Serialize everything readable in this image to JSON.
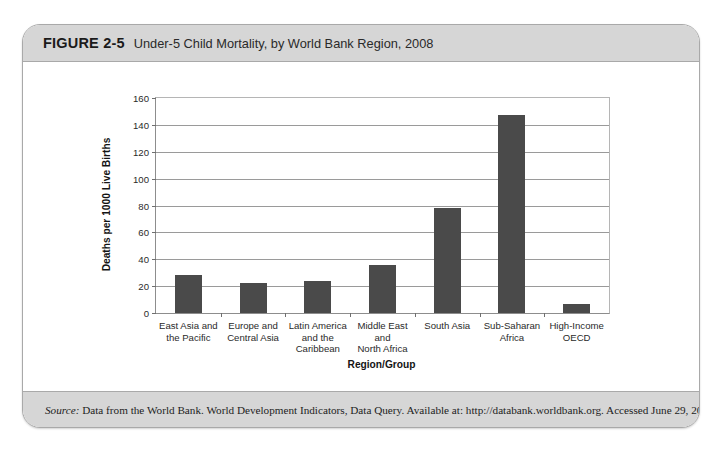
{
  "figure": {
    "number": "FIGURE 2-5",
    "title": "Under-5 Child Mortality, by World Bank Region, 2008",
    "source_label": "Source:",
    "source_text": " Data from the World Bank. World Development Indicators, Data Query. Available at: http://databank.worldbank.org. Accessed June 29, 2010."
  },
  "style": {
    "bar_color": "#4a4a4a",
    "band_color": "#d6d6d6",
    "grid_color": "#9a9a9a",
    "plot_bg": "#ffffff"
  },
  "chart_data": {
    "type": "bar",
    "title": "Under-5 Child Mortality, by World Bank Region, 2008",
    "xlabel": "Region/Group",
    "ylabel": "Deaths per 1000 Live Births",
    "ylim": [
      0,
      160
    ],
    "yticks": [
      0,
      20,
      40,
      60,
      80,
      100,
      120,
      140,
      160
    ],
    "ytick_labels": [
      "0",
      "20",
      "40",
      "60",
      "80",
      "100",
      "120",
      "140",
      "160"
    ],
    "grid": true,
    "legend": false,
    "categories": [
      "East Asia and\nthe Pacific",
      "Europe and\nCentral Asia",
      "Latin America\nand the\nCaribbean",
      "Middle East\nand\nNorth Africa",
      "South Asia",
      "Sub-Saharan\nAfrica",
      "High-Income\nOECD"
    ],
    "category_lines": [
      [
        "East Asia and",
        "the Pacific"
      ],
      [
        "Europe and",
        "Central Asia"
      ],
      [
        "Latin America",
        "and the",
        "Caribbean"
      ],
      [
        "Middle East",
        "and",
        "North Africa"
      ],
      [
        "South Asia"
      ],
      [
        "Sub-Saharan",
        "Africa"
      ],
      [
        "High-Income",
        "OECD"
      ]
    ],
    "values": [
      28,
      22,
      24,
      36,
      78,
      147,
      7
    ]
  }
}
